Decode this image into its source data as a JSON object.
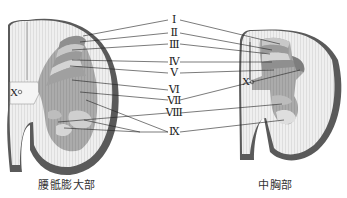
{
  "diagram": {
    "laminae_labels": [
      "Ⅰ",
      "Ⅱ",
      "Ⅲ",
      "Ⅳ",
      "Ⅴ",
      "Ⅵ",
      "Ⅶ",
      "Ⅷ",
      "Ⅸ"
    ],
    "central_label": "X",
    "left_section": {
      "caption": "腰骶膨大部"
    },
    "right_section": {
      "caption": "中胸部"
    },
    "colors": {
      "white_matter": "#eeeeee",
      "white_matter_stripe": "#dcdcdc",
      "pia_rim": "#555555",
      "gray_matter": "#a9a9a9",
      "gray_light": "#cfcfcf",
      "gray_dark": "#8c8c8c",
      "leader_line": "#222222"
    }
  }
}
